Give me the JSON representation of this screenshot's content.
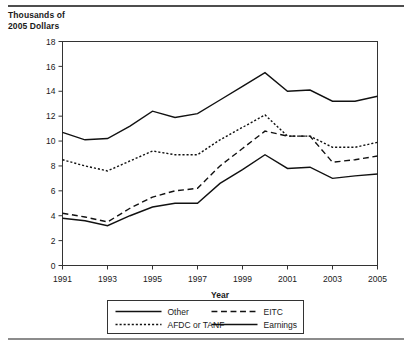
{
  "figure": {
    "y_axis_title": "Thousands of\n2005 Dollars",
    "x_axis_label": "Year"
  },
  "chart_data": {
    "type": "line",
    "title": "",
    "subtitle": "",
    "xlabel": "Year",
    "ylabel": "Thousands of 2005 Dollars",
    "xlim": [
      1991,
      2005
    ],
    "ylim": [
      0,
      18
    ],
    "x_ticks": [
      1991,
      1992,
      1993,
      1994,
      1995,
      1996,
      1997,
      1998,
      1999,
      2000,
      2001,
      2002,
      2003,
      2004,
      2005
    ],
    "x_tick_labels": [
      "1991",
      "",
      "1993",
      "",
      "1995",
      "",
      "1997",
      "",
      "1999",
      "",
      "2001",
      "",
      "2003",
      "",
      "2005"
    ],
    "y_ticks": [
      0,
      2,
      4,
      6,
      8,
      10,
      12,
      14,
      16,
      18
    ],
    "y_tick_labels": [
      "0",
      "2",
      "4",
      "6",
      "8",
      "10",
      "12",
      "14",
      "16",
      "18"
    ],
    "grid": false,
    "legend_position": "bottom",
    "x": [
      1991,
      1992,
      1993,
      1994,
      1995,
      1996,
      1997,
      1998,
      1999,
      2000,
      2001,
      2002,
      2003,
      2004,
      2005
    ],
    "series": [
      {
        "name": "Other",
        "style": "solid",
        "width": 1.4,
        "color": "#111111",
        "values": [
          10.7,
          10.1,
          10.2,
          11.2,
          12.4,
          11.9,
          12.2,
          13.3,
          14.4,
          15.5,
          14.0,
          14.1,
          13.2,
          13.2,
          13.6
        ]
      },
      {
        "name": "EITC",
        "style": "dashed",
        "width": 1.4,
        "color": "#111111",
        "values": [
          4.2,
          3.9,
          3.5,
          4.6,
          5.5,
          6.0,
          6.2,
          8.0,
          9.4,
          10.8,
          10.4,
          10.4,
          8.3,
          8.5,
          8.8
        ]
      },
      {
        "name": "AFDC or TANF",
        "style": "dotted",
        "width": 1.4,
        "color": "#111111",
        "values": [
          8.5,
          8.0,
          7.6,
          8.4,
          9.2,
          8.9,
          8.9,
          10.1,
          11.1,
          12.1,
          10.4,
          10.4,
          9.5,
          9.5,
          9.9
        ]
      },
      {
        "name": "Earnings",
        "style": "solid",
        "width": 1.4,
        "color": "#111111",
        "values": [
          3.8,
          3.6,
          3.2,
          4.0,
          4.7,
          5.0,
          5.0,
          6.6,
          7.7,
          8.9,
          7.8,
          7.9,
          7.0,
          7.2,
          7.35
        ]
      }
    ],
    "legend": [
      {
        "label": "Other",
        "style": "solid"
      },
      {
        "label": "EITC",
        "style": "dashed"
      },
      {
        "label": "AFDC or TANF",
        "style": "dotted"
      },
      {
        "label": "Earnings",
        "style": "solid"
      }
    ]
  }
}
